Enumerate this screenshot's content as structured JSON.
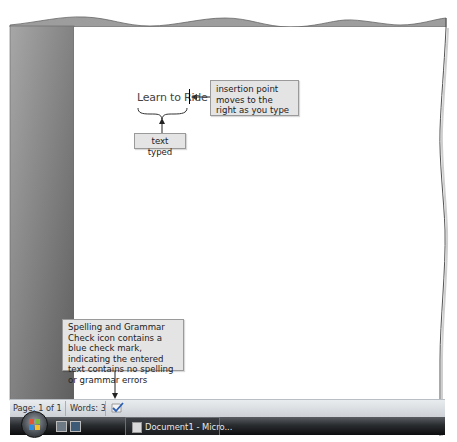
{
  "document": {
    "typed_text": "Learn to Ride"
  },
  "callouts": {
    "insertion_point": "insertion point moves to the right as you type",
    "text_typed": "text typed",
    "spelling_grammar": "Spelling and Grammar Check icon contains a blue check mark, indicating the entered text contains no spelling or grammar errors"
  },
  "status_bar": {
    "page": "Page: 1 of 1",
    "words": "Words: 3",
    "proofing_icon": "spelling-grammar-check-icon"
  },
  "taskbar": {
    "start_button": "start-orb",
    "quick_launch": [
      "show-desktop-icon",
      "switch-windows-icon"
    ],
    "task_button_label": "Document1 - Micro..."
  },
  "colors": {
    "left_pane": "#8a8a8a",
    "callout_bg": "#e4e4e4",
    "statusbar": "#dde1e5",
    "taskbar": "#1a1c1e"
  }
}
